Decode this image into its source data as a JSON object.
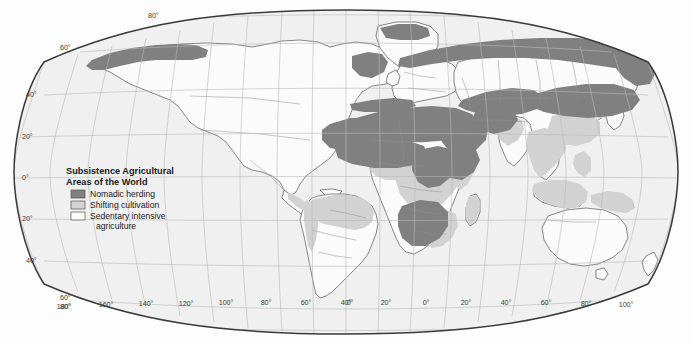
{
  "map": {
    "projection": "robinson",
    "title": "Subsistence Agricultural Areas of the World",
    "background_color": "#fdfdfd",
    "ocean_color": "#f0f0f0",
    "graticule_color": "#b9b9b9",
    "coastline_color": "#4a4a4a",
    "border_color": "#3a3a3a",
    "country_border_color": "#8a8a8a"
  },
  "legend": {
    "title_line1": "Subsistence Agricultural",
    "title_line2": "Areas of the World",
    "items": [
      {
        "label": "Nomadic herding",
        "color": "#808080"
      },
      {
        "label": "Shifting cultivation",
        "color": "#d2d2d2"
      },
      {
        "label": "Sedentary intensive",
        "label_cont": "agriculture",
        "color": "#fbfbfb"
      }
    ]
  },
  "graticule": {
    "latitude_labels": [
      "80°",
      "60°",
      "40°",
      "20°",
      "0°",
      "20°",
      "40°",
      "60°",
      "80°"
    ],
    "latitude_values": [
      80,
      60,
      40,
      20,
      0,
      -20,
      -40,
      -60,
      -80
    ],
    "longitude_labels": [
      "180°",
      "160°",
      "140°",
      "120°",
      "100°",
      "80°",
      "60°",
      "40°",
      "20°",
      "0°",
      "20°",
      "40°",
      "60°",
      "80°",
      "100°",
      "120°",
      "140°",
      "160°",
      "180°"
    ],
    "longitude_values": [
      -180,
      -160,
      -140,
      -120,
      -100,
      -80,
      -60,
      -40,
      -20,
      0,
      20,
      40,
      60,
      80,
      100,
      120,
      140,
      160,
      180
    ],
    "corner_top_label": "80°",
    "corner_left_top_label": "60°",
    "corner_bottom_left_label_upper": "60°",
    "corner_bottom_left_label_lower": "80°"
  },
  "regions": {
    "nomadic_herding": [
      "Alaska and Arctic Canada",
      "Northern Siberia",
      "Sahara and Sahel",
      "Arabian Peninsula",
      "Horn of Africa",
      "Central Asia and Mongolia",
      "Kalahari"
    ],
    "shifting_cultivation": [
      "Amazon Basin",
      "Central Africa",
      "Southeast Asia",
      "Indian Subcontinent margins",
      "Andes",
      "New Guinea"
    ],
    "sedentary_intensive": [
      "Remaining land areas"
    ]
  }
}
